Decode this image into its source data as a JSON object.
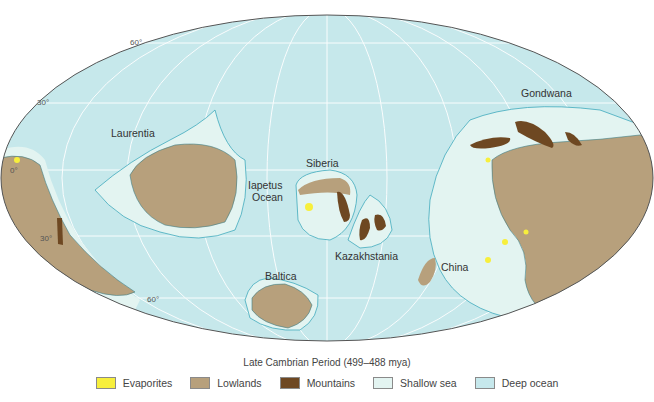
{
  "map": {
    "title": "Late Cambrian Period (499–488 mya)",
    "labels": {
      "laurentia": "Laurentia",
      "siberia": "Siberia",
      "iapetus_line1": "Iapetus",
      "iapetus_line2": "Ocean",
      "kazakhstania": "Kazakhstania",
      "baltica": "Baltica",
      "china": "China",
      "gondwana": "Gondwana"
    },
    "latitude_labels": {
      "n60": "60°",
      "n30": "30°",
      "eq": "0°",
      "s30": "30°",
      "s60": "60°"
    }
  },
  "legend": {
    "items": [
      {
        "label": "Evaporites",
        "color": "#f7ef3c"
      },
      {
        "label": "Lowlands",
        "color": "#b7a07c"
      },
      {
        "label": "Mountains",
        "color": "#6e4822"
      },
      {
        "label": "Shallow sea",
        "color": "#e3f4f1"
      },
      {
        "label": "Deep ocean",
        "color": "#c6e8ec"
      }
    ]
  },
  "colors": {
    "deep_ocean": "#c6e8ec",
    "shallow_sea": "#e3f4f1",
    "lowlands": "#b7a07c",
    "mountains": "#6e4822",
    "evaporites": "#f7ef3c",
    "coastline": "#3fa9bd",
    "graticule": "#ffffff",
    "border": "#555555"
  }
}
